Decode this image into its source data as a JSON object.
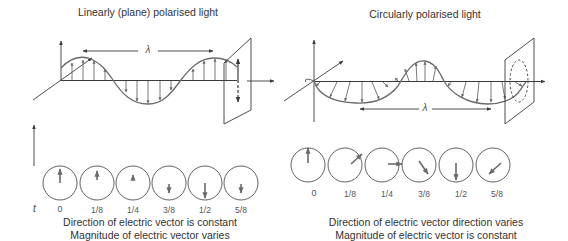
{
  "left_panel": {
    "title": "Linearly (plane) polarised light",
    "wavelength_label": "λ",
    "time_axis_label": "t",
    "time_labels": [
      "0",
      "1/8",
      "1/4",
      "3/8",
      "1/2",
      "5/8"
    ],
    "circle_vectors": [
      {
        "t": "0",
        "direction": "up",
        "magnitude": "full"
      },
      {
        "t": "1/8",
        "direction": "up",
        "magnitude": "medium"
      },
      {
        "t": "1/4",
        "direction": "up",
        "magnitude": "small"
      },
      {
        "t": "3/8",
        "direction": "down",
        "magnitude": "medium-small"
      },
      {
        "t": "1/2",
        "direction": "down",
        "magnitude": "full"
      },
      {
        "t": "5/8",
        "direction": "down",
        "magnitude": "medium-small"
      }
    ],
    "caption_line1": "Direction of electric vector is constant",
    "caption_line2": "Magnitude of electric vector varies"
  },
  "right_panel": {
    "title": "Circularly polarised light",
    "wavelength_label": "λ",
    "time_labels": [
      "0",
      "1/8",
      "1/4",
      "3/8",
      "1/2",
      "5/8"
    ],
    "circle_vectors": [
      {
        "t": "0",
        "direction": "up"
      },
      {
        "t": "1/8",
        "direction": "up-right"
      },
      {
        "t": "1/4",
        "direction": "right"
      },
      {
        "t": "3/8",
        "direction": "down-right"
      },
      {
        "t": "1/2",
        "direction": "down"
      },
      {
        "t": "5/8",
        "direction": "down-left"
      }
    ],
    "caption_line1": "Direction of electric vector direction varies",
    "caption_line2": "Magnitude of electric vector is constant"
  },
  "colors": {
    "line": "#3a3a3a",
    "vector": "#6a6a6a",
    "background": "#ffffff"
  }
}
